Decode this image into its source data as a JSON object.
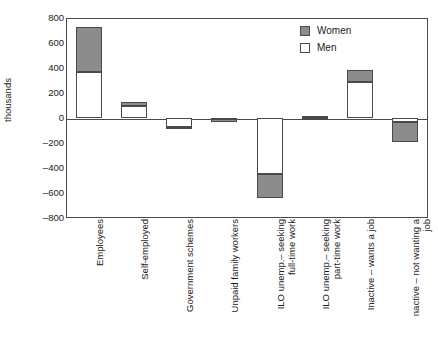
{
  "chart_data": {
    "type": "bar",
    "title": "",
    "xlabel": "",
    "ylabel": "thousands",
    "ylim": [
      -800,
      800
    ],
    "yticks": [
      "800",
      "600",
      "400",
      "200",
      "0",
      "-200",
      "-400",
      "-600",
      "-800"
    ],
    "ytick_values": [
      800,
      600,
      400,
      200,
      0,
      -200,
      -400,
      -600,
      -800
    ],
    "grid": false,
    "stacked": true,
    "legend_position": "top-right",
    "legend": [
      "Women",
      "Men"
    ],
    "colors": {
      "women": "#8c8c8c",
      "men": "#ffffff",
      "axis": "#4a4a4a",
      "text": "#1a1a1a"
    },
    "categories": [
      "Employees",
      "Self-employed",
      "Government schemes",
      "Unpaid family workers",
      "ILO unemp.– seeking\nfull-time work",
      "ILO unemp.– seeking\npart-time work",
      "Inactive – wants a job",
      "nactive – not wanting a\njob"
    ],
    "series": [
      {
        "name": "Men",
        "values": [
          365,
          95,
          -70,
          -5,
          -450,
          -12,
          285,
          -35
        ]
      },
      {
        "name": "Women",
        "values": [
          360,
          35,
          -20,
          -25,
          -190,
          14,
          98,
          -155
        ]
      }
    ],
    "totals": [
      725,
      130,
      -90,
      -30,
      -640,
      2,
      383,
      -190
    ]
  },
  "axis": {
    "ylabel": "thousands"
  },
  "legend": {
    "items": [
      {
        "label": "Women",
        "swatch": "women"
      },
      {
        "label": "Men",
        "swatch": "men"
      }
    ]
  }
}
